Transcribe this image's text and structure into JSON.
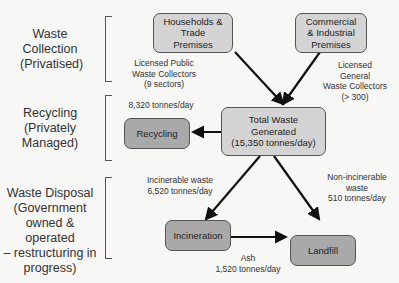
{
  "sections": [
    {
      "id": "collection",
      "label": "Waste\nCollection\n(Privatised)"
    },
    {
      "id": "recycling",
      "label": "Recycling\n(Privately\nManaged)"
    },
    {
      "id": "disposal",
      "label": "Waste Disposal\n(Government\nowned & operated\n– restructuring in\nprogress)"
    }
  ],
  "nodes": {
    "households": "Households &\nTrade\nPremises",
    "commercial": "Commercial\n& Industrial\nPremises",
    "total": "Total Waste\nGenerated\n(15,350 tonnes/day)",
    "recycling": "Recycling",
    "incineration": "Incineration",
    "landfill": "Landfill"
  },
  "edge_labels": {
    "public_collectors": "Licensed Public\nWaste Collectors\n(9 sectors)",
    "general_collectors": "Licensed\nGeneral\nWaste Collectors\n(> 300)",
    "recycling_flow": "8,320 tonnes/day",
    "incinerable": "Incinerable waste\n6,520 tonnes/day",
    "non_incinerable": "Non-incinerable\nwaste\n510 tonnes/day",
    "ash": "Ash\n1,520 tonnes/day"
  },
  "colors": {
    "light_box": "#d4d4d4",
    "dark_box": "#a9a9a9",
    "arrow": "#111111"
  }
}
